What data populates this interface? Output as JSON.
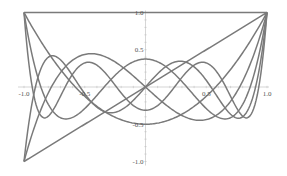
{
  "chart_data": {
    "type": "line",
    "title": "",
    "xlabel": "",
    "ylabel": "",
    "xlim": [
      -1.0,
      1.0
    ],
    "ylim": [
      -1.0,
      1.0
    ],
    "grid": false,
    "legend": "none",
    "x_ticks": [
      {
        "value": -1.0,
        "label": "-1.0"
      },
      {
        "value": -0.5,
        "label": "-0.5"
      },
      {
        "value": 0.5,
        "label": "0.5"
      },
      {
        "value": 1.0,
        "label": "1.0"
      }
    ],
    "y_ticks": [
      {
        "value": 1.0,
        "label": "1.0"
      },
      {
        "value": 0.5,
        "label": "0.5"
      },
      {
        "value": -0.5,
        "label": "-0.5"
      },
      {
        "value": -1.0,
        "label": "-1.0"
      }
    ],
    "series": [
      {
        "name": "P0(x)",
        "description": "Legendre polynomial degree 0",
        "coefficients": [
          1
        ]
      },
      {
        "name": "P1(x)",
        "description": "Legendre polynomial degree 1",
        "coefficients": [
          0,
          1
        ]
      },
      {
        "name": "P2(x)",
        "description": "Legendre polynomial degree 2",
        "coefficients": [
          -0.5,
          0,
          1.5
        ]
      },
      {
        "name": "P3(x)",
        "description": "Legendre polynomial degree 3",
        "coefficients": [
          0,
          -1.5,
          0,
          2.5
        ]
      },
      {
        "name": "P4(x)",
        "description": "Legendre polynomial degree 4",
        "coefficients": [
          0.375,
          0,
          -3.75,
          0,
          4.375
        ]
      },
      {
        "name": "P5(x)",
        "description": "Legendre polynomial degree 5",
        "coefficients": [
          0,
          1.875,
          0,
          -8.75,
          0,
          7.875
        ]
      },
      {
        "name": "P6(x)",
        "description": "Legendre polynomial degree 6",
        "coefficients": [
          -0.3125,
          0,
          6.5625,
          0,
          -19.6875,
          0,
          14.4375
        ]
      }
    ],
    "line_color": "#7a7a7a",
    "axis_color": "#bbbbbb"
  }
}
